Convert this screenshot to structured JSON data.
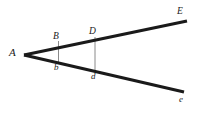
{
  "diagram": {
    "background_color": "#ffffff",
    "ray_color": "#1a1a1a",
    "segment_color": "#8a8a8a",
    "label_color": "#1a1a1a",
    "labels": {
      "apex": "A",
      "upper_near": "B",
      "lower_near": "b",
      "upper_far": "D",
      "lower_far": "d",
      "upper_end": "E",
      "lower_end": "e"
    },
    "geometry": {
      "apex_point": [
        24,
        55
      ],
      "upper_ray": [
        [
          24,
          55
        ],
        [
          187,
          21
        ]
      ],
      "lower_ray": [
        [
          24,
          55
        ],
        [
          184,
          92
        ]
      ],
      "segment_Bb": [
        [
          58,
          41
        ],
        [
          58,
          62
        ]
      ],
      "segment_Dd": [
        [
          95,
          37
        ],
        [
          95,
          71
        ]
      ],
      "ray_width": 3.2,
      "segment_width": 1
    }
  }
}
